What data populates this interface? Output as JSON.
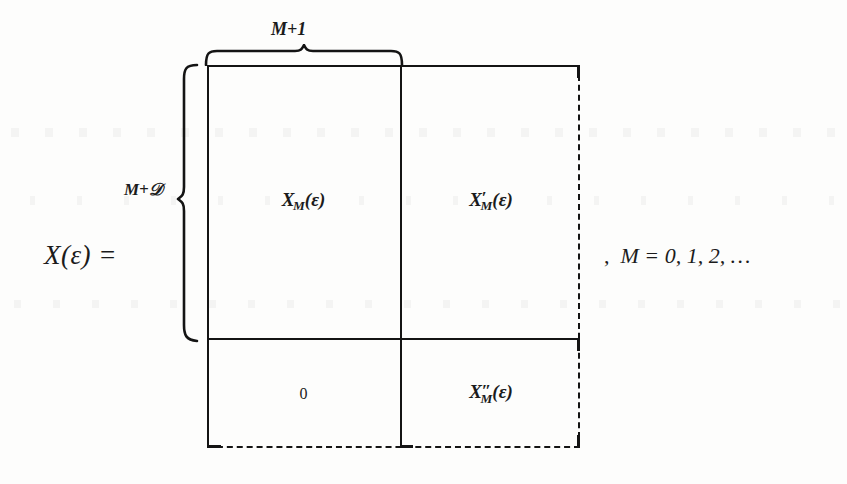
{
  "equation": {
    "lhs": "X(ε) =",
    "trailing_comma": ",",
    "trailing_condition": "M = 0, 1, 2, …"
  },
  "braces": {
    "top": {
      "label": "M+1",
      "icon": "horizontal-brace-icon",
      "spans": "left-column-width"
    },
    "left": {
      "label_prefix": "M+",
      "label_symbol": "𝒟",
      "label": "M+𝒟",
      "icon": "vertical-brace-icon",
      "spans": "top-block-height"
    }
  },
  "matrix": {
    "name": "partitioned-matrix",
    "edges": {
      "top": "solid",
      "left": "solid",
      "right": "dashed",
      "bottom": "dashed"
    },
    "dividers": {
      "vertical": "solid",
      "horizontal": "solid"
    },
    "cells": [
      {
        "position": "top-left",
        "name": "cell-x-m",
        "base": "X",
        "subscript": "M",
        "prime": "",
        "argument": "(ε)",
        "text": "X_M(ε)"
      },
      {
        "position": "top-right",
        "name": "cell-x-m-prime",
        "base": "X",
        "subscript": "M",
        "prime": "′",
        "argument": "(ε)",
        "text": "X′_M(ε)"
      },
      {
        "position": "bottom-left",
        "name": "cell-zero",
        "base": "0",
        "subscript": "",
        "prime": "",
        "argument": "",
        "text": "0"
      },
      {
        "position": "bottom-right",
        "name": "cell-x-m-double-prime",
        "base": "X",
        "subscript": "M",
        "prime": "″",
        "argument": "(ε)",
        "text": "X″_M(ε)"
      }
    ]
  },
  "colors": {
    "ink": "#141414",
    "text": "#1b1b1b",
    "paper": "#fdfdfc"
  }
}
